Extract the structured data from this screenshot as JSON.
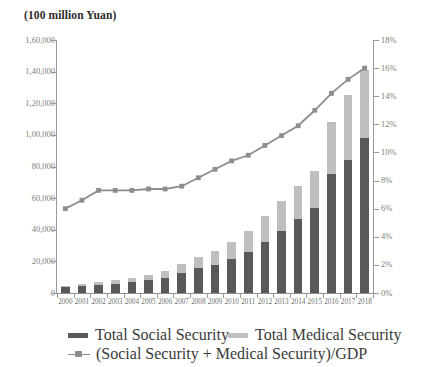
{
  "chart_data": {
    "type": "bar",
    "title": "(100 million Yuan)",
    "xlabel": "",
    "ylabel": "",
    "y2label": "",
    "grid": false,
    "legend_position": "bottom",
    "categories": [
      "2000",
      "2001",
      "2002",
      "2003",
      "2004",
      "2005",
      "2006",
      "2007",
      "2008",
      "2009",
      "2010",
      "2011",
      "2012",
      "2013",
      "2014",
      "2015",
      "2016",
      "2017",
      "2018"
    ],
    "ylim": [
      0,
      160000
    ],
    "yticks": [
      0,
      20000,
      40000,
      60000,
      80000,
      100000,
      120000,
      140000,
      160000
    ],
    "ytick_labels": [
      "0",
      "20,000",
      "40,000",
      "60,000",
      "80,000",
      "1,00,000",
      "1,20,000",
      "1,40,000",
      "1,60,000"
    ],
    "y2lim": [
      0,
      18
    ],
    "y2ticks": [
      0,
      2,
      4,
      6,
      8,
      10,
      12,
      14,
      16,
      18
    ],
    "y2tick_labels": [
      "0%",
      "2%",
      "4%",
      "6%",
      "8%",
      "10%",
      "12%",
      "14%",
      "16%",
      "18%"
    ],
    "stacked": true,
    "series": [
      {
        "name": "Total Social Security",
        "color": "#595959",
        "axis": "left",
        "kind": "bar",
        "values": [
          3500,
          4200,
          5100,
          5800,
          6900,
          8200,
          9800,
          12500,
          15600,
          18000,
          21500,
          26000,
          32500,
          39000,
          46500,
          54000,
          75000,
          84000,
          98000
        ]
      },
      {
        "name": "Total Medical Security",
        "color": "#bfbfbf",
        "axis": "left",
        "kind": "bar",
        "values": [
          1200,
          1500,
          1900,
          2300,
          2800,
          3500,
          4400,
          5600,
          7000,
          8500,
          10500,
          13000,
          16000,
          19500,
          21000,
          23000,
          33000,
          41000,
          43000
        ]
      },
      {
        "name": "(Social Security + Medical Security)/GDP",
        "color": "#8d8d8d",
        "axis": "right",
        "kind": "line",
        "values": [
          6.0,
          6.6,
          7.3,
          7.3,
          7.3,
          7.4,
          7.4,
          7.6,
          8.2,
          8.8,
          9.4,
          9.8,
          10.5,
          11.2,
          11.9,
          13.0,
          14.2,
          15.2,
          16.0
        ]
      }
    ]
  },
  "legend": {
    "items": [
      {
        "label": "Total Social Security",
        "marker": "dark-swatch"
      },
      {
        "label": "Total Medical Security",
        "marker": "light-swatch"
      },
      {
        "label": "(Social Security + Medical Security)/GDP",
        "marker": "line-marker"
      }
    ]
  }
}
